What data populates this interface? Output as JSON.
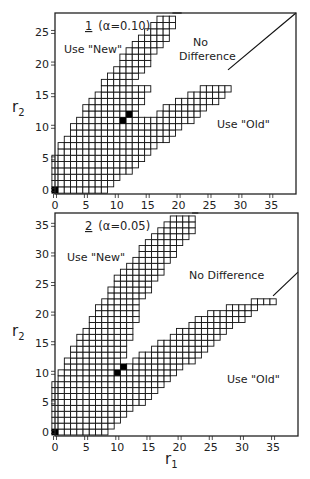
{
  "chart_data": [
    {
      "type": "heatmap",
      "title": "1 (α=0.10)",
      "panel_label": "1",
      "alpha_label": "(α=0.10)",
      "xlabel": "r1",
      "ylabel": "r2",
      "xlim": [
        0,
        39
      ],
      "ylim": [
        0,
        28
      ],
      "xticks": [
        0,
        5,
        10,
        15,
        20,
        25,
        30,
        35
      ],
      "yticks": [
        0,
        5,
        10,
        15,
        20,
        25
      ],
      "regions": [
        "Use \"New\"",
        "No Difference",
        "Use \"Old\""
      ],
      "region_labels": {
        "new": "Use \"New\"",
        "nodiff_line1": "No",
        "nodiff_line2": "Difference",
        "old": "Use \"Old\""
      },
      "grid_rows": [
        {
          "r2": 0,
          "from": 0,
          "to": 8
        },
        {
          "r2": 1,
          "from": 0,
          "to": 9
        },
        {
          "r2": 2,
          "from": 0,
          "to": 10
        },
        {
          "r2": 3,
          "from": 0,
          "to": 12
        },
        {
          "r2": 4,
          "from": 0,
          "to": 13
        },
        {
          "r2": 5,
          "from": 0,
          "to": 14
        },
        {
          "r2": 6,
          "from": 1,
          "to": 15
        },
        {
          "r2": 7,
          "from": 1,
          "to": 16
        },
        {
          "r2": 8,
          "from": 2,
          "to": 18
        },
        {
          "r2": 9,
          "from": 3,
          "to": 19
        },
        {
          "r2": 10,
          "from": 3,
          "to": 20
        },
        {
          "r2": 11,
          "from": 4,
          "to": 22
        },
        {
          "r2": 12,
          "from": 5,
          "to": 23
        },
        {
          "r2": 13,
          "from": 5,
          "to": 24
        },
        {
          "r2": 14,
          "from": 6,
          "to": 26
        },
        {
          "r2": 15,
          "from": 7,
          "to": 27
        },
        {
          "r2": 16,
          "from": 8,
          "to": 28
        },
        {
          "r2": 17,
          "from": 8,
          "to": 12
        },
        {
          "r2": 18,
          "from": 9,
          "to": 13
        },
        {
          "r2": 19,
          "from": 10,
          "to": 14
        },
        {
          "r2": 20,
          "from": 11,
          "to": 15
        },
        {
          "r2": 21,
          "from": 11,
          "to": 15
        },
        {
          "r2": 22,
          "from": 12,
          "to": 16
        },
        {
          "r2": 23,
          "from": 13,
          "to": 17
        },
        {
          "r2": 24,
          "from": 14,
          "to": 18
        },
        {
          "r2": 25,
          "from": 15,
          "to": 18
        },
        {
          "r2": 26,
          "from": 16,
          "to": 19
        },
        {
          "r2": 27,
          "from": 17,
          "to": 19
        }
      ],
      "gap_rows": [
        {
          "r2": 12,
          "gap_from": 14,
          "gap_to": 16
        },
        {
          "r2": 13,
          "gap_from": 14,
          "gap_to": 17
        },
        {
          "r2": 14,
          "gap_from": 15,
          "gap_to": 19
        },
        {
          "r2": 15,
          "gap_from": 15,
          "gap_to": 21
        },
        {
          "r2": 16,
          "gap_from": 16,
          "gap_to": 23
        }
      ],
      "filled_cells": [
        [
          0,
          0
        ],
        [
          11,
          11
        ],
        [
          12,
          12
        ]
      ],
      "upper_line": [
        [
          19,
          28
        ],
        [
          20.5,
          29
        ]
      ],
      "lower_line": [
        [
          28,
          19
        ],
        [
          39,
          29
        ]
      ]
    },
    {
      "type": "heatmap",
      "title": "2 (α=0.05)",
      "panel_label": "2",
      "alpha_label": "(α=0.05)",
      "xlabel": "r1",
      "ylabel": "r2",
      "xlim": [
        0,
        39
      ],
      "ylim": [
        0,
        37
      ],
      "xticks": [
        0,
        5,
        10,
        15,
        20,
        25,
        30,
        35
      ],
      "yticks": [
        0,
        5,
        10,
        15,
        20,
        25,
        30,
        35
      ],
      "regions": [
        "Use \"New\"",
        "No Difference",
        "Use \"Old\""
      ],
      "region_labels": {
        "new": "Use \"New\"",
        "nodiff": "No Difference",
        "old": "Use \"Old\""
      },
      "grid_rows": [
        {
          "r2": 0,
          "from": 0,
          "to": 8
        },
        {
          "r2": 1,
          "from": 0,
          "to": 9
        },
        {
          "r2": 2,
          "from": 0,
          "to": 10
        },
        {
          "r2": 3,
          "from": 0,
          "to": 11
        },
        {
          "r2": 4,
          "from": 0,
          "to": 12
        },
        {
          "r2": 5,
          "from": 0,
          "to": 14
        },
        {
          "r2": 6,
          "from": 0,
          "to": 15
        },
        {
          "r2": 7,
          "from": 0,
          "to": 16
        },
        {
          "r2": 8,
          "from": 0,
          "to": 17
        },
        {
          "r2": 9,
          "from": 1,
          "to": 18
        },
        {
          "r2": 10,
          "from": 1,
          "to": 19
        },
        {
          "r2": 11,
          "from": 2,
          "to": 20
        },
        {
          "r2": 12,
          "from": 2,
          "to": 22
        },
        {
          "r2": 13,
          "from": 3,
          "to": 23
        },
        {
          "r2": 14,
          "from": 3,
          "to": 24
        },
        {
          "r2": 15,
          "from": 4,
          "to": 25
        },
        {
          "r2": 16,
          "from": 4,
          "to": 26
        },
        {
          "r2": 17,
          "from": 5,
          "to": 27
        },
        {
          "r2": 18,
          "from": 6,
          "to": 28
        },
        {
          "r2": 19,
          "from": 6,
          "to": 30
        },
        {
          "r2": 20,
          "from": 7,
          "to": 31
        },
        {
          "r2": 21,
          "from": 7,
          "to": 32
        },
        {
          "r2": 22,
          "from": 8,
          "to": 35
        },
        {
          "r2": 23,
          "from": 9,
          "to": 14
        },
        {
          "r2": 24,
          "from": 9,
          "to": 15
        },
        {
          "r2": 25,
          "from": 10,
          "to": 15
        },
        {
          "r2": 26,
          "from": 10,
          "to": 16
        },
        {
          "r2": 27,
          "from": 11,
          "to": 17
        },
        {
          "r2": 28,
          "from": 12,
          "to": 17
        },
        {
          "r2": 29,
          "from": 13,
          "to": 18
        },
        {
          "r2": 30,
          "from": 14,
          "to": 19
        },
        {
          "r2": 31,
          "from": 14,
          "to": 19
        },
        {
          "r2": 32,
          "from": 15,
          "to": 20
        },
        {
          "r2": 33,
          "from": 16,
          "to": 21
        },
        {
          "r2": 34,
          "from": 17,
          "to": 22
        },
        {
          "r2": 35,
          "from": 18,
          "to": 22
        },
        {
          "r2": 36,
          "from": 19,
          "to": 22
        }
      ],
      "gap_rows": [
        {
          "r2": 12,
          "gap_from": 11,
          "gap_to": 12
        },
        {
          "r2": 13,
          "gap_from": 12,
          "gap_to": 13
        },
        {
          "r2": 14,
          "gap_from": 12,
          "gap_to": 15
        },
        {
          "r2": 15,
          "gap_from": 12,
          "gap_to": 16
        },
        {
          "r2": 16,
          "gap_from": 13,
          "gap_to": 18
        },
        {
          "r2": 17,
          "gap_from": 13,
          "gap_to": 19
        },
        {
          "r2": 18,
          "gap_from": 13,
          "gap_to": 21
        },
        {
          "r2": 19,
          "gap_from": 14,
          "gap_to": 22
        },
        {
          "r2": 20,
          "gap_from": 14,
          "gap_to": 24
        },
        {
          "r2": 21,
          "gap_from": 14,
          "gap_to": 27
        },
        {
          "r2": 22,
          "gap_from": 14,
          "gap_to": 31
        }
      ],
      "filled_cells": [
        [
          0,
          0
        ],
        [
          10,
          10
        ],
        [
          11,
          11
        ]
      ],
      "upper_line": [
        [
          22,
          37
        ],
        [
          23,
          38
        ]
      ],
      "lower_line": [
        [
          35,
          23
        ],
        [
          39,
          27
        ]
      ]
    }
  ],
  "figure": {
    "xlabel_main": "r",
    "xlabel_sub": "1",
    "ylabel_main": "r",
    "ylabel_sub": "2"
  }
}
